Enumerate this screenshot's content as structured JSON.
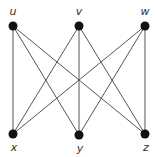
{
  "diagram": {
    "type": "complete-bipartite-graph",
    "name": "K3,3",
    "colors": {
      "edge": "#555555",
      "node": "#111111",
      "label": "#333333",
      "background": "#ffffff"
    },
    "nodes": [
      {
        "id": "u",
        "label": "u",
        "x": 13,
        "y": 26,
        "lx": 13,
        "ly": 15
      },
      {
        "id": "v",
        "label": "v",
        "x": 79,
        "y": 26,
        "lx": 79,
        "ly": 15
      },
      {
        "id": "w",
        "label": "w",
        "x": 145,
        "y": 26,
        "lx": 145,
        "ly": 15
      },
      {
        "id": "x",
        "label": "x",
        "x": 13,
        "y": 134,
        "lx": 14,
        "ly": 151
      },
      {
        "id": "y",
        "label": "y",
        "x": 79,
        "y": 135,
        "lx": 80,
        "ly": 152
      },
      {
        "id": "z",
        "label": "z",
        "x": 145,
        "y": 134,
        "lx": 146,
        "ly": 151
      }
    ],
    "edges": [
      [
        "u",
        "x"
      ],
      [
        "u",
        "y"
      ],
      [
        "u",
        "z"
      ],
      [
        "v",
        "x"
      ],
      [
        "v",
        "y"
      ],
      [
        "v",
        "z"
      ],
      [
        "w",
        "x"
      ],
      [
        "w",
        "y"
      ],
      [
        "w",
        "z"
      ]
    ]
  }
}
